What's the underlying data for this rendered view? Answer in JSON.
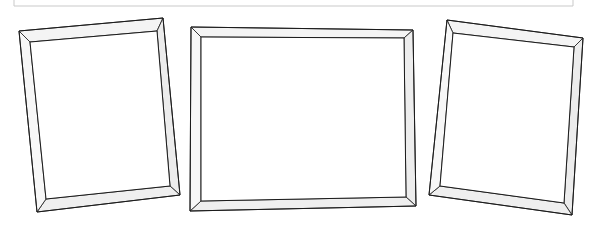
{
  "image": {
    "title": "Three empty picture frames in perspective",
    "kind": "line-art-illustration",
    "width": 599,
    "height": 230,
    "background_color": "#ffffff",
    "outline_color": "#1b1b1b",
    "bevel_shade_color": "#f2f2f2",
    "bevel_shade_color_dark": "#e6e6e6",
    "aperture_color": "#ffffff",
    "crop_rule_color": "#c9c9c9"
  },
  "crop_rule": {
    "label": "partial-border-above",
    "x1": 14,
    "y1": 6,
    "x2": 573,
    "y2": 6,
    "left_tick_y1": 0,
    "left_tick_y2": 6,
    "right_tick_y1": 0,
    "right_tick_y2": 6
  },
  "frames": [
    {
      "id": "frame-left",
      "label": "Left picture frame",
      "orientation": "portrait",
      "tilt": "rotated counter-clockwise, top edge rises to the right",
      "outer": [
        [
          19,
          31
        ],
        [
          163,
          18
        ],
        [
          180,
          195
        ],
        [
          37,
          212
        ]
      ],
      "inner": [
        [
          30,
          42
        ],
        [
          157,
          31
        ],
        [
          170,
          186
        ],
        [
          46,
          199
        ]
      ],
      "face_shades": {
        "top": "#f4f4f4",
        "right": "#ececec",
        "bottom": "#efefef",
        "left": "#f7f7f7"
      }
    },
    {
      "id": "frame-center",
      "label": "Center picture frame",
      "orientation": "landscape",
      "tilt": "nearly front-facing, very slight tilt",
      "outer": [
        [
          191,
          27
        ],
        [
          413,
          30
        ],
        [
          416,
          206
        ],
        [
          190,
          211
        ]
      ],
      "inner": [
        [
          201,
          37
        ],
        [
          404,
          38
        ],
        [
          406,
          197
        ],
        [
          201,
          201
        ]
      ],
      "face_shades": {
        "top": "#f4f4f4",
        "right": "#ededed",
        "bottom": "#efefef",
        "left": "#f7f7f7"
      }
    },
    {
      "id": "frame-right",
      "label": "Right picture frame",
      "orientation": "portrait",
      "tilt": "rotated clockwise, top edge falls to the right",
      "outer": [
        [
          447,
          20
        ],
        [
          583,
          38
        ],
        [
          572,
          215
        ],
        [
          429,
          195
        ]
      ],
      "inner": [
        [
          453,
          33
        ],
        [
          574,
          47
        ],
        [
          564,
          203
        ],
        [
          440,
          186
        ]
      ],
      "face_shades": {
        "top": "#f4f4f4",
        "right": "#ececec",
        "bottom": "#efefef",
        "left": "#f7f7f7"
      }
    }
  ]
}
